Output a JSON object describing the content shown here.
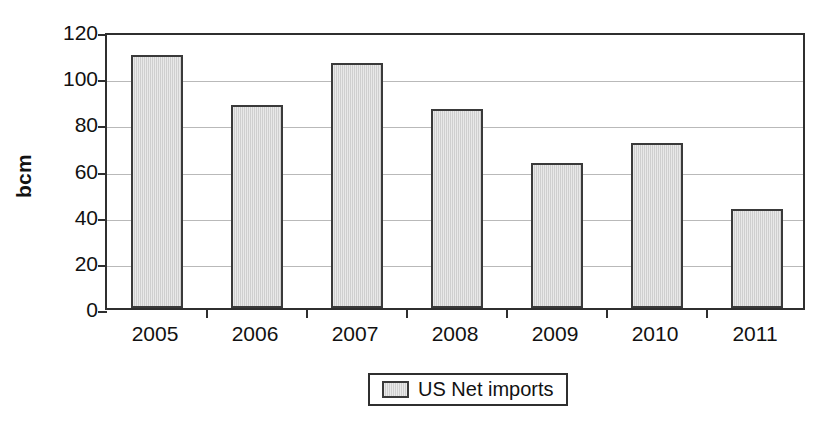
{
  "chart_data": {
    "type": "bar",
    "title": "",
    "xlabel": "",
    "ylabel": "bcm",
    "categories": [
      "2005",
      "2006",
      "2007",
      "2008",
      "2009",
      "2010",
      "2011"
    ],
    "series": [
      {
        "name": "US Net imports",
        "values": [
          109.5,
          87.8,
          106,
          86,
          63,
          71.5,
          43
        ]
      }
    ],
    "ylim": [
      0,
      120
    ],
    "ytick_values": [
      0,
      20,
      40,
      60,
      80,
      100,
      120
    ],
    "ytick_labels": [
      "0",
      "20",
      "40",
      "60",
      "80",
      "100",
      "120"
    ],
    "grid": true,
    "legend_position": "bottom-center",
    "colors": {
      "bar_fill": "#cfcfcf",
      "bar_border": "#3a3a3a",
      "gridline": "#b9b9b9",
      "axis": "#2f2f2f",
      "text": "#111111",
      "background": "#ffffff"
    }
  },
  "legend": {
    "entries": [
      {
        "label": "US Net imports",
        "swatch_name": "legend-swatch-us-net-imports"
      }
    ]
  }
}
